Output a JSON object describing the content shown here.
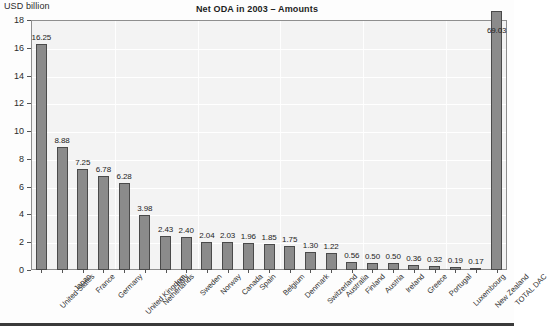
{
  "chart_data": {
    "type": "bar",
    "title": "Net ODA in 2003 – Amounts",
    "xlabel": "",
    "ylabel": "USD billion",
    "ylim": [
      0,
      18
    ],
    "yticks": [
      0,
      2,
      4,
      6,
      8,
      10,
      12,
      14,
      16,
      18
    ],
    "grid": true,
    "legend": "none",
    "note": "The TOTAL DAC bar (69.03) exceeds the axis maximum and is drawn clipped above the plot frame.",
    "categories": [
      "United States",
      "Japan",
      "France",
      "Germany",
      "United Kingdom",
      "Netherlands",
      "Italy",
      "Sweden",
      "Norway",
      "Canada",
      "Spain",
      "Belgium",
      "Denmark",
      "Switzerland",
      "Australia",
      "Finland",
      "Austria",
      "Ireland",
      "Greece",
      "Portugal",
      "Luxembourg",
      "New Zealand",
      "TOTAL DAC"
    ],
    "values": [
      16.25,
      8.88,
      7.25,
      6.78,
      6.28,
      3.98,
      2.43,
      2.4,
      2.04,
      2.03,
      1.96,
      1.85,
      1.75,
      1.3,
      1.22,
      0.56,
      0.5,
      0.5,
      0.36,
      0.32,
      0.19,
      0.17,
      69.03
    ],
    "value_labels": [
      "16.25",
      "8.88",
      "7.25",
      "6.78",
      "6.28",
      "3.98",
      "2.43",
      "2.40",
      "2.04",
      "2.03",
      "1.96",
      "1.85",
      "1.75",
      "1.30",
      "1.22",
      "0.56",
      "0.50",
      "0.50",
      "0.36",
      "0.32",
      "0.19",
      "0.17",
      "69.03"
    ],
    "colors": {
      "bar_fill": "#8b8b8b",
      "bar_edge": "#4a4a4a",
      "plot_background": "#f3f3f3",
      "grid": "#ffffff",
      "frame": "#8e8e8e",
      "text": "#1d1d1d"
    }
  }
}
